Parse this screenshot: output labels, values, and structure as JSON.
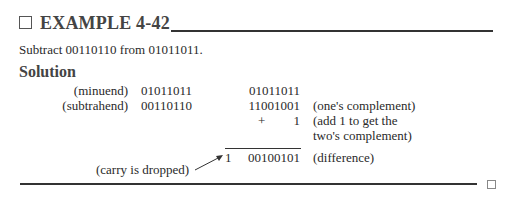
{
  "header": {
    "title": "EXAMPLE 4-42",
    "marker_icon": "square-outline-icon"
  },
  "problem": "Subtract 00110110 from 01011011.",
  "solution_heading": "Solution",
  "work": {
    "minuend_label": "(minuend)",
    "minuend_value": "01011011",
    "subtrahend_label": "(subtrahend)",
    "subtrahend_value": "00110110",
    "right_minuend": "01011011",
    "ones_complement": "11001001",
    "ones_complement_note": "(one's complement)",
    "plus_sign": "+",
    "add_one": "1",
    "add_note_line1": "(add 1 to get the",
    "add_note_line2": "two's complement)",
    "carry": "1",
    "difference": "00100101",
    "difference_note": "(difference)",
    "carry_note": "(carry is dropped)"
  },
  "end_marker_icon": "square-outline-icon"
}
